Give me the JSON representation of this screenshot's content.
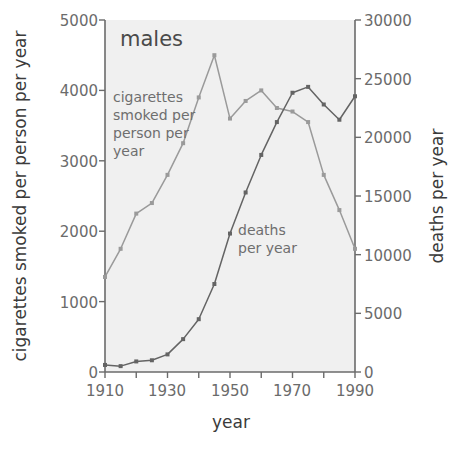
{
  "chart_data": {
    "type": "line",
    "title": "males",
    "xlabel": "year",
    "ylabel": "cigarettes smoked per person per year",
    "y2label": "deaths per year",
    "x": [
      1910,
      1915,
      1920,
      1925,
      1930,
      1935,
      1940,
      1945,
      1950,
      1955,
      1960,
      1965,
      1970,
      1975,
      1980,
      1985,
      1990
    ],
    "xlim": [
      1910,
      1990
    ],
    "ylim": [
      0,
      5000
    ],
    "y2lim": [
      0,
      30000
    ],
    "xticks": [
      1910,
      1920,
      1930,
      1940,
      1950,
      1960,
      1970,
      1980,
      1990
    ],
    "xtick_labels_major": [
      "1910",
      "1930",
      "1950",
      "1970",
      "1990"
    ],
    "xticks_major": [
      1910,
      1930,
      1950,
      1970,
      1990
    ],
    "yticks": [
      0,
      1000,
      2000,
      3000,
      4000,
      5000
    ],
    "ytick_labels": [
      "0",
      "1000",
      "2000",
      "3000",
      "4000",
      "5000"
    ],
    "y2ticks": [
      0,
      5000,
      10000,
      15000,
      20000,
      25000,
      30000
    ],
    "y2tick_labels": [
      "0",
      "5000",
      "10000",
      "15000",
      "20000",
      "25000",
      "30000"
    ],
    "grid": false,
    "legend_position": "inline-annotations",
    "series": [
      {
        "name": "cigarettes smoked per person per year",
        "axis": "left",
        "color": "#9a9a9a",
        "annotation": "cigarettes\nsmoked per\nperson per\nyear",
        "annotation_lines": [
          "cigarettes",
          "smoked per",
          "person per",
          "year"
        ],
        "values": [
          1350,
          1750,
          2250,
          2400,
          2800,
          3250,
          3900,
          4500,
          3600,
          3850,
          4000,
          3750,
          3700,
          3550,
          2800,
          2300,
          1750
        ]
      },
      {
        "name": "deaths per year",
        "axis": "right",
        "color": "#646464",
        "annotation": "deaths\nper year",
        "annotation_lines": [
          "deaths",
          "per year"
        ],
        "values": [
          600,
          500,
          900,
          1000,
          1500,
          2800,
          4500,
          7500,
          11800,
          15300,
          18500,
          21300,
          23800,
          24300,
          22800,
          21500,
          23500
        ]
      }
    ]
  },
  "colors": {
    "plot_background": "#f0f0f0",
    "axis": "#6b6b6b",
    "text": "#4a4a4a",
    "cigarettes_series": "#9a9a9a",
    "deaths_series": "#646464"
  },
  "labels": {
    "title": "males",
    "xlabel": "year",
    "ylabel_left": "cigarettes smoked per person per year",
    "ylabel_right": "deaths per year",
    "annot_cig_1": "cigarettes",
    "annot_cig_2": "smoked per",
    "annot_cig_3": "person per",
    "annot_cig_4": "year",
    "annot_deaths_1": "deaths",
    "annot_deaths_2": "per year",
    "y_0": "0",
    "y_1000": "1000",
    "y_2000": "2000",
    "y_3000": "3000",
    "y_4000": "4000",
    "y_5000": "5000",
    "y2_0": "0",
    "y2_5000": "5000",
    "y2_10000": "10000",
    "y2_15000": "15000",
    "y2_20000": "20000",
    "y2_25000": "25000",
    "y2_30000": "30000",
    "x_1910": "1910",
    "x_1930": "1930",
    "x_1950": "1950",
    "x_1970": "1970",
    "x_1990": "1990"
  }
}
